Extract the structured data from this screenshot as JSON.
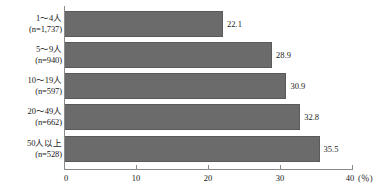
{
  "chart_data": {
    "type": "bar",
    "orientation": "horizontal",
    "title": "",
    "xlabel": "(%)",
    "ylabel": "",
    "xlim": [
      0,
      40
    ],
    "xticks": [
      "0",
      "10",
      "20",
      "30",
      "40"
    ],
    "grid": false,
    "legend": null,
    "bar_color": "#6b6b6b",
    "categories": [
      "1～4人",
      "5～9人",
      "10～19人",
      "20～49人",
      "50人以上"
    ],
    "category_notes": [
      "(n=1,737)",
      "(n=940)",
      "(n=597)",
      "(n=662)",
      "(n=528)"
    ],
    "values": [
      22.1,
      28.9,
      30.9,
      32.8,
      35.5
    ],
    "value_labels": [
      "22.1",
      "28.9",
      "30.9",
      "32.8",
      "35.5"
    ]
  },
  "axis": {
    "unit_label": "(％)"
  }
}
